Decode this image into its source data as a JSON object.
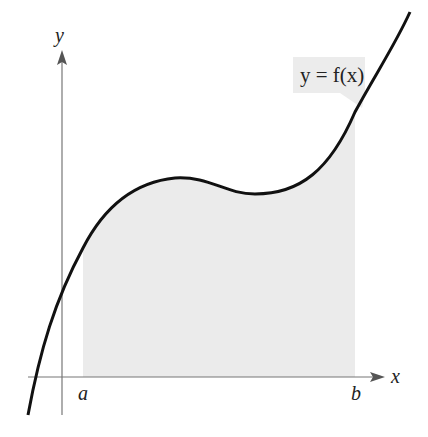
{
  "diagram": {
    "type": "area-under-curve",
    "axes": {
      "x_label": "x",
      "y_label": "y"
    },
    "bounds": {
      "a_label": "a",
      "b_label": "b"
    },
    "function_label": "y = f(x)",
    "colors": {
      "curve": "#111111",
      "axis": "#777777",
      "shaded_region": "#ebebeb",
      "callout_bg": "#ececec"
    }
  }
}
